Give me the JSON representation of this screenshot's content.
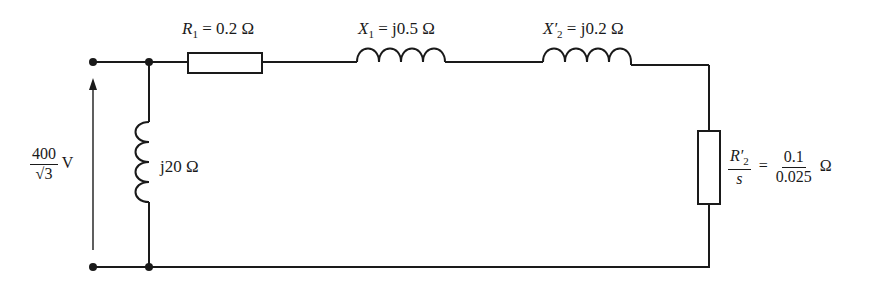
{
  "diagram": {
    "type": "equivalent-circuit",
    "source": {
      "numerator": "400",
      "denominator": "√3",
      "unit": "V"
    },
    "R1": {
      "symbol": "R",
      "subscript": "1",
      "value": "= 0.2 Ω"
    },
    "X1": {
      "symbol": "X",
      "subscript": "1",
      "value": "= j0.5 Ω"
    },
    "X2": {
      "symbol": "X′",
      "subscript": "2",
      "value": "= j0.2 Ω"
    },
    "Xm": {
      "value": "j20 Ω"
    },
    "R2s": {
      "num_symbol": "R′",
      "num_subscript": "2",
      "den_symbol": "s",
      "equals": "=",
      "value_numerator": "0.1",
      "value_denominator": "0.025",
      "unit": "Ω"
    },
    "colors": {
      "line": "#1a1a1a",
      "background": "#ffffff"
    }
  }
}
